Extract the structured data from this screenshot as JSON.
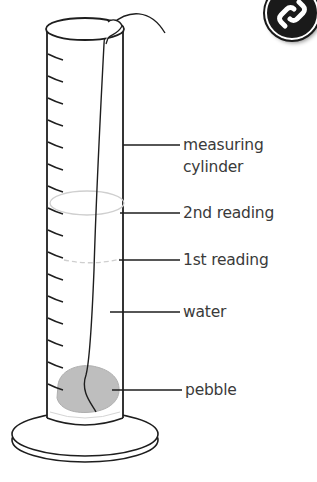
{
  "figure": {
    "badge_icon": "chain-link-icon",
    "colors": {
      "outline": "#1e1e1e",
      "pebble": "#b9b9b9",
      "second_reading_line": "#c8c8c8",
      "first_reading_line": "#c8c8c8",
      "label_text": "#3a3a3a"
    }
  },
  "labels": {
    "measuring_cylinder_line1": "measuring",
    "measuring_cylinder_line2": "cylinder",
    "second_reading": "2nd reading",
    "first_reading": "1st reading",
    "water": "water",
    "pebble": "pebble"
  },
  "scale": {
    "tick_count": 16,
    "tick_spacing_px": 22
  }
}
